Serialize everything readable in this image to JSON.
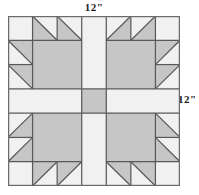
{
  "figure": {
    "labels": {
      "top": "12\"",
      "right": "12\""
    }
  },
  "colors": {
    "background": "#f1f1f1",
    "patch_gray": "#c6c6c6",
    "line": "#595959",
    "outer_border": "#6b6b6b",
    "text": "#1a1a1a",
    "page": "#ffffff"
  },
  "block": {
    "name": "Bear's Paw",
    "grid_columns": 7,
    "grid_rows": 7,
    "finished_width_inches": 12,
    "finished_height_inches": 12,
    "unit_count": 4,
    "center_square": {
      "name": "center-square",
      "fill": "patch_gray",
      "grid_x": 3,
      "grid_y": 3,
      "grid_w": 1,
      "grid_h": 1
    },
    "sashing": {
      "name": "sashing-cross",
      "fill": "background",
      "description": "white cross dividing the four paw units"
    },
    "paws": [
      {
        "name": "paw-top-left",
        "corner": "top-left",
        "rotation_deg": 0,
        "big_square": {
          "grid_x": 1,
          "grid_y": 1,
          "grid_w": 2,
          "grid_h": 2,
          "fill": "patch_gray"
        },
        "corner_square": {
          "grid_x": 0,
          "grid_y": 0,
          "fill": "background"
        },
        "claws_top": [
          {
            "grid_x": 1,
            "grid_y": 0,
            "gray_corner": "bottom-left"
          },
          {
            "grid_x": 2,
            "grid_y": 0,
            "gray_corner": "bottom-left"
          }
        ],
        "claws_side": [
          {
            "grid_x": 0,
            "grid_y": 1,
            "gray_corner": "top-right"
          },
          {
            "grid_x": 0,
            "grid_y": 2,
            "gray_corner": "top-right"
          }
        ]
      },
      {
        "name": "paw-top-right",
        "corner": "top-right",
        "rotation_deg": 90,
        "big_square": {
          "grid_x": 4,
          "grid_y": 1,
          "grid_w": 2,
          "grid_h": 2,
          "fill": "patch_gray"
        },
        "corner_square": {
          "grid_x": 6,
          "grid_y": 0,
          "fill": "background"
        },
        "claws_top": [
          {
            "grid_x": 4,
            "grid_y": 0,
            "gray_corner": "bottom-right"
          },
          {
            "grid_x": 5,
            "grid_y": 0,
            "gray_corner": "bottom-right"
          }
        ],
        "claws_side": [
          {
            "grid_x": 6,
            "grid_y": 1,
            "gray_corner": "top-left"
          },
          {
            "grid_x": 6,
            "grid_y": 2,
            "gray_corner": "top-left"
          }
        ]
      },
      {
        "name": "paw-bottom-left",
        "corner": "bottom-left",
        "rotation_deg": 270,
        "big_square": {
          "grid_x": 1,
          "grid_y": 4,
          "grid_w": 2,
          "grid_h": 2,
          "fill": "patch_gray"
        },
        "corner_square": {
          "grid_x": 0,
          "grid_y": 6,
          "fill": "background"
        },
        "claws_top": [
          {
            "grid_x": 1,
            "grid_y": 6,
            "gray_corner": "top-left"
          },
          {
            "grid_x": 2,
            "grid_y": 6,
            "gray_corner": "top-left"
          }
        ],
        "claws_side": [
          {
            "grid_x": 0,
            "grid_y": 4,
            "gray_corner": "bottom-right"
          },
          {
            "grid_x": 0,
            "grid_y": 5,
            "gray_corner": "bottom-right"
          }
        ]
      },
      {
        "name": "paw-bottom-right",
        "corner": "bottom-right",
        "rotation_deg": 180,
        "big_square": {
          "grid_x": 4,
          "grid_y": 4,
          "grid_w": 2,
          "grid_h": 2,
          "fill": "patch_gray"
        },
        "corner_square": {
          "grid_x": 6,
          "grid_y": 6,
          "fill": "background"
        },
        "claws_top": [
          {
            "grid_x": 4,
            "grid_y": 6,
            "gray_corner": "top-right"
          },
          {
            "grid_x": 5,
            "grid_y": 6,
            "gray_corner": "top-right"
          }
        ],
        "claws_side": [
          {
            "grid_x": 6,
            "grid_y": 4,
            "gray_corner": "bottom-left"
          },
          {
            "grid_x": 6,
            "grid_y": 5,
            "gray_corner": "bottom-left"
          }
        ]
      }
    ]
  }
}
